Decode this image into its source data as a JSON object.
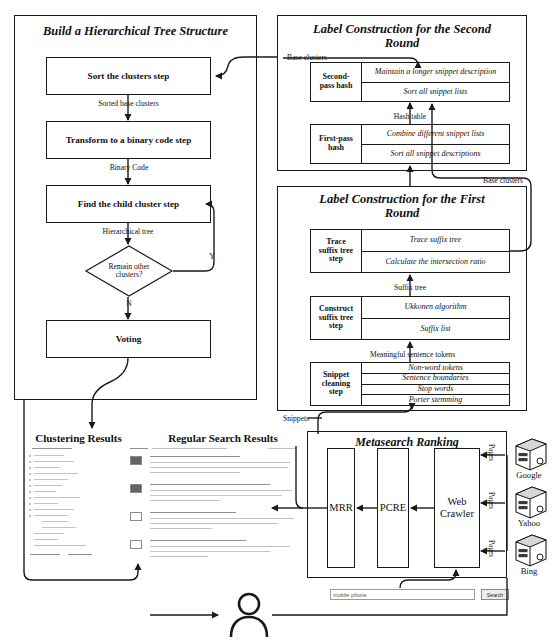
{
  "figure": {
    "top_caption": ""
  },
  "panels": {
    "build_tree": {
      "title": "Build a Hierarchical Tree Structure",
      "steps": [
        {
          "label": "Sort the clusters step"
        },
        {
          "label": "Transform to a binary code step"
        },
        {
          "label": "Find the child cluster step"
        },
        {
          "label": "Voting"
        }
      ],
      "decision": {
        "line1": "Remain other",
        "line2": "clusters?"
      },
      "edges": {
        "sorted_base_clusters": "Sorted base clusters",
        "binary_code": "Binary Code",
        "hierarchical_tree": "Hierarchical tree",
        "yes": "Y",
        "no": "N"
      }
    },
    "second_round": {
      "title_line1": "Label Construction for the Second",
      "title_line2": "Round",
      "input_label": "Base clusters",
      "hash_table_label": "Hash table",
      "blocks": [
        {
          "name_line1": "Second-",
          "name_line2": "pass hash",
          "rows": [
            "Maintain a longer snippet description",
            "Sort all snippet lists"
          ]
        },
        {
          "name_line1": "First-pass",
          "name_line2": "hash",
          "rows": [
            "Combine different snippet lists",
            "Sort all snippet descriptions"
          ]
        }
      ]
    },
    "first_round": {
      "title_line1": "Label Construction for the First",
      "title_line2": "Round",
      "output_label": "Base clusters",
      "edges": {
        "suffix_tree": "Suffix tree",
        "meaningful_tokens": "Meaningful sentence tokens",
        "snippets": "Snippets"
      },
      "blocks": [
        {
          "name_line1": "Trace",
          "name_line2": "suffix tree",
          "name_line3": "step",
          "rows": [
            "Trace suffix tree",
            "Calculate the intersection ratio"
          ]
        },
        {
          "name_line1": "Construct",
          "name_line2": "suffix tree",
          "name_line3": "step",
          "rows": [
            "Ukkonen algorithm",
            "Suffix list"
          ]
        },
        {
          "name_line1": "Snippet",
          "name_line2": "cleaning",
          "name_line3": "step",
          "rows": [
            "Non-word tokens",
            "Sentence boundaries",
            "Stop words",
            "Porter stemming"
          ]
        }
      ]
    },
    "metasearch": {
      "title": "Metasearch Ranking",
      "columns": [
        {
          "label": "MRR"
        },
        {
          "label": "PCRE"
        },
        {
          "label": "Web Crawler"
        }
      ],
      "pages_labels": [
        "Pages",
        "Pages",
        "Pages"
      ],
      "engines": [
        {
          "name": "Google"
        },
        {
          "name": "Yahoo"
        },
        {
          "name": "Bing"
        }
      ]
    }
  },
  "results": {
    "clustering_heading": "Clustering Results",
    "regular_heading": "Regular Search Results"
  },
  "search": {
    "query_value": "mobile phone",
    "placeholder": "Search the web",
    "button_label": "Search"
  },
  "icons": {
    "user": "user-icon",
    "server": "server-icon"
  }
}
